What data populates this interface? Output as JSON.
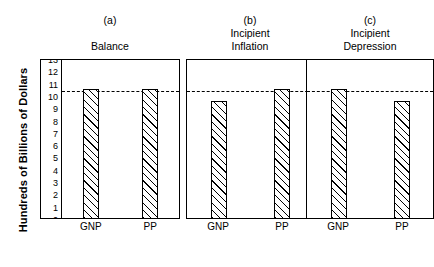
{
  "chart_data": {
    "type": "bar",
    "title": "",
    "ylabel": "Hundreds of Billions of Dollars",
    "xlabel": "",
    "ylim": [
      0,
      13
    ],
    "grid": false,
    "legend": "none",
    "yticks": [
      13,
      12,
      11,
      10,
      9,
      8,
      7,
      6,
      5,
      4,
      3,
      2,
      1,
      0
    ],
    "categories": [
      "GNP",
      "PP"
    ],
    "reference_line": {
      "value": 10.5,
      "style": "dashed",
      "label": ""
    },
    "panels": [
      {
        "caption": "(a)",
        "title": "Balance",
        "show_yaxis": true,
        "categories": [
          "GNP",
          "PP"
        ],
        "values": [
          10.5,
          10.5
        ]
      },
      {
        "caption": "(b)",
        "title": "Incipient\nInflation",
        "show_yaxis": false,
        "categories": [
          "GNP",
          "PP"
        ],
        "values": [
          9.5,
          10.5
        ]
      },
      {
        "caption": "(c)",
        "title": "Incipient\nDepression",
        "show_yaxis": false,
        "categories": [
          "GNP",
          "PP"
        ],
        "values": [
          10.5,
          9.5
        ]
      }
    ]
  },
  "colors": {
    "ink": "#000000",
    "background": "#ffffff",
    "bar_fill": "#ffffff",
    "bar_hatch": "#000000"
  }
}
